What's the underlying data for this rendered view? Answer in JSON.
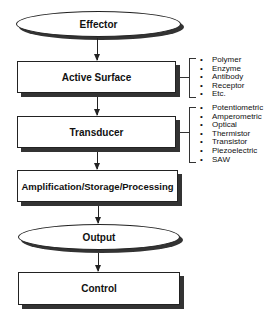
{
  "diagram": {
    "nodes": [
      {
        "id": "effector",
        "label": "Effector",
        "shape": "ellipse"
      },
      {
        "id": "active_surface",
        "label": "Active Surface",
        "shape": "box"
      },
      {
        "id": "transducer",
        "label": "Transducer",
        "shape": "box"
      },
      {
        "id": "amplification",
        "label": "Amplification/Storage/Processing",
        "shape": "box"
      },
      {
        "id": "output",
        "label": "Output",
        "shape": "ellipse"
      },
      {
        "id": "control",
        "label": "Control",
        "shape": "box"
      }
    ],
    "edges": [
      [
        "effector",
        "active_surface"
      ],
      [
        "active_surface",
        "transducer"
      ],
      [
        "transducer",
        "amplification"
      ],
      [
        "amplification",
        "output"
      ],
      [
        "output",
        "control"
      ]
    ],
    "annotations": {
      "active_surface": [
        "Polymer",
        "Enzyme",
        "Antibody",
        "Receptor",
        "Etc."
      ],
      "transducer": [
        "Potentiometric",
        "Amperometric",
        "Optical",
        "Thermistor",
        "Transistor",
        "Piezoelectric",
        "SAW"
      ]
    }
  }
}
